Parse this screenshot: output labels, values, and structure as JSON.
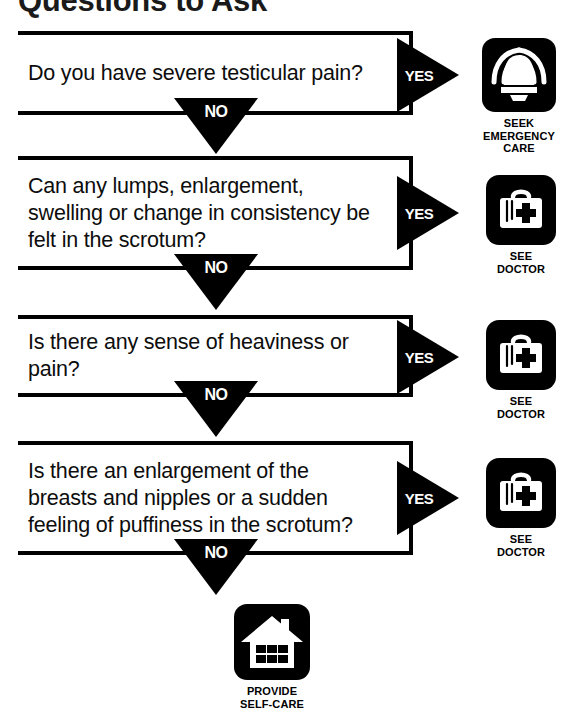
{
  "title": "Questions to Ask",
  "labels": {
    "yes": "YES",
    "no": "NO"
  },
  "colors": {
    "ink": "#000000",
    "paper": "#ffffff"
  },
  "questions": [
    {
      "id": "q1",
      "text": "Do you have severe testicular pain?",
      "yes_label": "YES",
      "no_label": "NO"
    },
    {
      "id": "q2",
      "text": "Can any lumps, enlargement, swelling or change in consistency be felt in the scrotum?",
      "yes_label": "YES",
      "no_label": "NO"
    },
    {
      "id": "q3",
      "text": "Is there any sense of heaviness or pain?",
      "yes_label": "YES",
      "no_label": "NO"
    },
    {
      "id": "q4",
      "text": "Is there an enlargement of the breasts and nipples or a sudden feeling of puffiness in the scrotum?",
      "yes_label": "YES",
      "no_label": "NO"
    }
  ],
  "outcomes": [
    {
      "id": "outcome-emergency",
      "icon": "alarm-bell-icon",
      "caption": "SEEK\nEMERGENCY\nCARE"
    },
    {
      "id": "outcome-doctor-1",
      "icon": "doctor-bag-icon",
      "caption": "SEE\nDOCTOR"
    },
    {
      "id": "outcome-doctor-2",
      "icon": "doctor-bag-icon",
      "caption": "SEE\nDOCTOR"
    },
    {
      "id": "outcome-doctor-3",
      "icon": "doctor-bag-icon",
      "caption": "SEE\nDOCTOR"
    },
    {
      "id": "outcome-self-care",
      "icon": "house-icon",
      "caption": "PROVIDE\nSELF-CARE"
    }
  ]
}
